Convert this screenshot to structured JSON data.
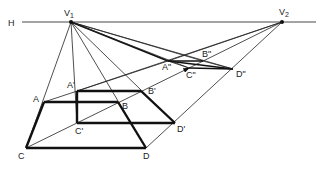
{
  "diagram": {
    "type": "two-point perspective construction",
    "horizon": {
      "label": "H",
      "y": 22,
      "x_start": 22,
      "x_end": 316
    },
    "vanishing_points": [
      {
        "id": "v1",
        "label": "V",
        "sub": "1",
        "x": 71,
        "y": 22
      },
      {
        "id": "v2",
        "label": "V",
        "sub": "2",
        "x": 282,
        "y": 22
      }
    ],
    "points": {
      "A": {
        "label": "A",
        "x": 44,
        "y": 102
      },
      "B": {
        "label": "B",
        "x": 118,
        "y": 102
      },
      "C": {
        "label": "C",
        "x": 26,
        "y": 148
      },
      "D": {
        "label": "D",
        "x": 146,
        "y": 148
      },
      "A1": {
        "label": "A'",
        "x": 77,
        "y": 91
      },
      "B1": {
        "label": "B'",
        "x": 141,
        "y": 91
      },
      "C1": {
        "label": "C'",
        "x": 77,
        "y": 123
      },
      "D1": {
        "label": "D'",
        "x": 175,
        "y": 123
      },
      "A2": {
        "label": "A\"",
        "x": 168,
        "y": 61
      },
      "B2": {
        "label": "B\"",
        "x": 203,
        "y": 61
      },
      "C2": {
        "label": "C\"",
        "x": 189,
        "y": 68
      },
      "D2": {
        "label": "D\"",
        "x": 233,
        "y": 69
      }
    },
    "labels": {
      "H": "H",
      "V1": "V",
      "V1_sub": "1",
      "V2": "V",
      "V2_sub": "2",
      "A": "A",
      "B": "B",
      "C": "C",
      "D": "D",
      "A1": "A'",
      "B1": "B'",
      "C1": "C'",
      "D1": "D'",
      "A2": "A\"",
      "B2": "B\"",
      "C2": "C\"",
      "D2": "D\""
    },
    "colors": {
      "line": "#222222",
      "background": "#ffffff"
    }
  }
}
